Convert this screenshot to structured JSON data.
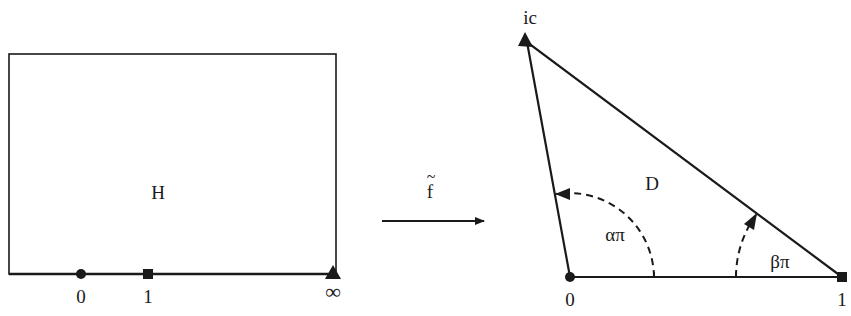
{
  "figure": {
    "left_panel": {
      "region_label": "H",
      "boundary_points": [
        {
          "label": "0",
          "marker": "circle"
        },
        {
          "label": "1",
          "marker": "square"
        },
        {
          "label": "∞",
          "marker": "triangle"
        }
      ]
    },
    "mapping": {
      "label": "f",
      "accent": "~"
    },
    "right_panel": {
      "region_label": "D",
      "vertices": [
        {
          "label": "0",
          "marker": "circle"
        },
        {
          "label": "1",
          "marker": "square"
        },
        {
          "label": "ic",
          "marker": "triangle"
        }
      ],
      "angles": [
        {
          "label": "απ",
          "vertex": "0"
        },
        {
          "label": "βπ",
          "vertex": "1"
        }
      ]
    },
    "colors": {
      "stroke": "#1a1a1a",
      "background": "#ffffff"
    }
  }
}
